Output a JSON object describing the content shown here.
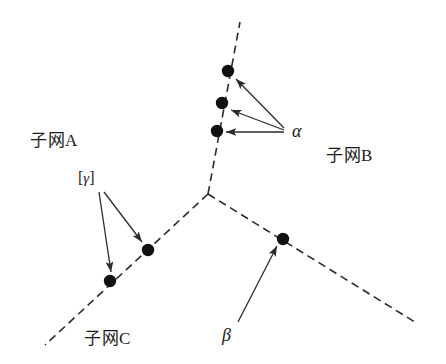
{
  "figure": {
    "background_color": "#ffffff",
    "stroke_color": "#2b2b2b",
    "node_color": "#111111",
    "width": 446,
    "height": 364
  },
  "labels": {
    "subnet_a": "子网A",
    "subnet_b": "子网B",
    "subnet_c": "子网C",
    "alpha": "α",
    "beta": "β",
    "gamma_bracket_open": "[",
    "gamma": "γ",
    "gamma_bracket_close": "]"
  },
  "diagram_data": {
    "type": "tree-topology",
    "junction": {
      "x": 208,
      "y": 194
    },
    "branches": [
      {
        "name": "subnet-b-branch",
        "label": "子网B",
        "from": {
          "x": 208,
          "y": 194
        },
        "to": {
          "x": 240,
          "y": 22
        },
        "style": "dashed"
      },
      {
        "name": "subnet-a-c-branch",
        "label": "子网A / 子网C",
        "from": {
          "x": 208,
          "y": 194
        },
        "to": {
          "x": 45,
          "y": 345
        },
        "style": "dashed"
      },
      {
        "name": "lower-right-branch",
        "label": "",
        "from": {
          "x": 208,
          "y": 194
        },
        "to": {
          "x": 418,
          "y": 324
        },
        "style": "dashed"
      }
    ],
    "nodes": [
      {
        "id": "b1",
        "x": 228,
        "y": 71,
        "branch": "subnet-b-branch",
        "marker": "alpha"
      },
      {
        "id": "b2",
        "x": 222,
        "y": 103,
        "branch": "subnet-b-branch",
        "marker": "alpha"
      },
      {
        "id": "b3",
        "x": 217,
        "y": 131,
        "branch": "subnet-b-branch",
        "marker": "alpha"
      },
      {
        "id": "a1",
        "x": 148,
        "y": 250,
        "branch": "subnet-a-c-branch",
        "marker": "gamma"
      },
      {
        "id": "a2",
        "x": 110,
        "y": 281,
        "branch": "subnet-a-c-branch",
        "marker": "gamma"
      },
      {
        "id": "c1",
        "x": 283,
        "y": 239,
        "branch": "lower-right-branch",
        "marker": "beta"
      }
    ],
    "annotations": [
      {
        "name": "alpha-annotation",
        "label": "α",
        "label_pos": {
          "x": 292,
          "y": 124
        },
        "arrows": [
          {
            "from": {
              "x": 284,
              "y": 128
            },
            "to": {
              "x": 236,
              "y": 79
            }
          },
          {
            "from": {
              "x": 284,
              "y": 130
            },
            "to": {
              "x": 231,
              "y": 110
            }
          },
          {
            "from": {
              "x": 284,
              "y": 132
            },
            "to": {
              "x": 226,
              "y": 132
            }
          }
        ]
      },
      {
        "name": "gamma-annotation",
        "label": "[γ]",
        "label_pos": {
          "x": 78,
          "y": 170
        },
        "arrows": [
          {
            "from": {
              "x": 99,
              "y": 192
            },
            "to": {
              "x": 111,
              "y": 272
            }
          },
          {
            "from": {
              "x": 104,
              "y": 192
            },
            "to": {
              "x": 142,
              "y": 242
            }
          }
        ]
      },
      {
        "name": "beta-annotation",
        "label": "β",
        "label_pos": {
          "x": 222,
          "y": 326
        },
        "arrows": [
          {
            "from": {
              "x": 238,
              "y": 322
            },
            "to": {
              "x": 277,
              "y": 246
            }
          }
        ]
      }
    ],
    "region_labels": [
      {
        "name": "subnet-a-label",
        "text": "子网A",
        "x": 30,
        "y": 132
      },
      {
        "name": "subnet-b-label",
        "text": "子网B",
        "x": 326,
        "y": 147
      },
      {
        "name": "subnet-c-label",
        "text": "子网C",
        "x": 84,
        "y": 330
      }
    ]
  }
}
